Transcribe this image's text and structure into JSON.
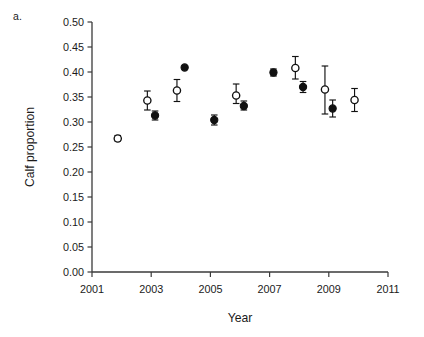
{
  "figure": {
    "panel_label": "a."
  },
  "chart_data": {
    "type": "scatter",
    "title": "",
    "xlabel": "Year",
    "ylabel": "Calf proportion",
    "xlim": [
      2001,
      2011
    ],
    "ylim": [
      0.0,
      0.5
    ],
    "grid": false,
    "legend": "none",
    "xticks": [
      2001,
      2003,
      2005,
      2007,
      2009,
      2011
    ],
    "xtick_labels": [
      "2001",
      "2003",
      "2005",
      "2007",
      "2009",
      "2011"
    ],
    "xticks_minor": [
      2002,
      2004,
      2006,
      2008,
      2010
    ],
    "yticks": [
      0.0,
      0.05,
      0.1,
      0.15,
      0.2,
      0.25,
      0.3,
      0.35,
      0.4,
      0.45,
      0.5
    ],
    "ytick_labels": [
      "0.00",
      "0.05",
      "0.10",
      "0.15",
      "0.20",
      "0.25",
      "0.30",
      "0.35",
      "0.40",
      "0.45",
      "0.50"
    ],
    "marker_offset_years": 0.13,
    "series": [
      {
        "name": "open-circle-series",
        "marker": "open-circle",
        "color": "#111111",
        "x": [
          2002,
          2003,
          2004,
          2006,
          2008,
          2009,
          2010
        ],
        "values": [
          0.267,
          0.343,
          0.363,
          0.353,
          0.408,
          0.365,
          0.344
        ],
        "err_low": [
          0.005,
          0.019,
          0.022,
          0.016,
          0.022,
          0.049,
          0.023
        ],
        "err_high": [
          0.006,
          0.019,
          0.022,
          0.023,
          0.023,
          0.047,
          0.023
        ]
      },
      {
        "name": "filled-circle-series",
        "marker": "filled-circle",
        "color": "#111111",
        "x": [
          2003,
          2004,
          2005,
          2006,
          2007,
          2008,
          2009
        ],
        "values": [
          0.313,
          0.409,
          0.304,
          0.332,
          0.399,
          0.37,
          0.327
        ],
        "err_low": [
          0.009,
          0.0,
          0.01,
          0.008,
          0.007,
          0.011,
          0.017
        ],
        "err_high": [
          0.009,
          0.0,
          0.01,
          0.01,
          0.007,
          0.011,
          0.017
        ]
      }
    ]
  }
}
